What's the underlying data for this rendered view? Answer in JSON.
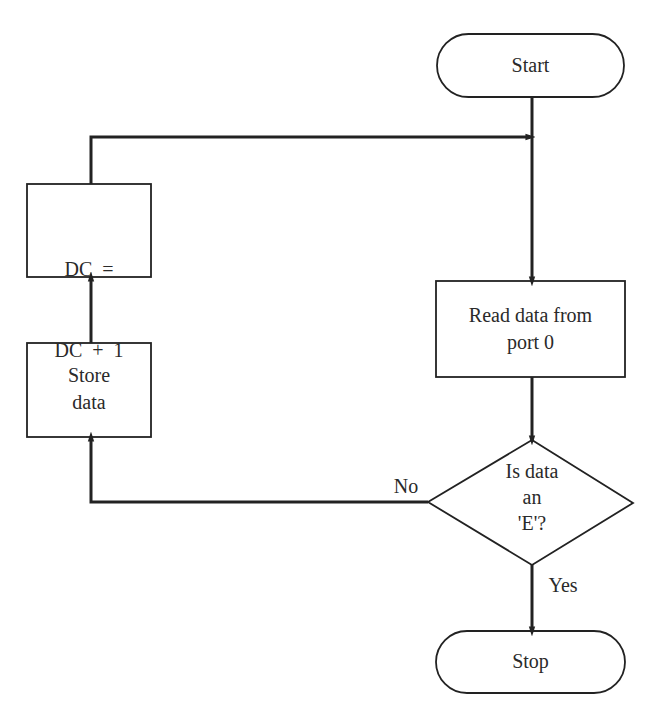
{
  "nodes": {
    "start": {
      "label": "Start",
      "shape": "terminal"
    },
    "read": {
      "label_line1": "Read data from",
      "label_line2": "port 0",
      "shape": "process"
    },
    "decision": {
      "label_line1": "Is data",
      "label_line2": "an",
      "label_line3": "'E'?",
      "shape": "decision"
    },
    "stop": {
      "label": "Stop",
      "shape": "terminal"
    },
    "store": {
      "label_line1": "Store",
      "label_line2": "data",
      "shape": "process"
    },
    "increment": {
      "label_line1": "DC  =",
      "label_line2": "DC  +  1",
      "shape": "process"
    }
  },
  "edges": {
    "no_label": "No",
    "yes_label": "Yes"
  },
  "colors": {
    "stroke": "#222222",
    "background": "#ffffff"
  }
}
